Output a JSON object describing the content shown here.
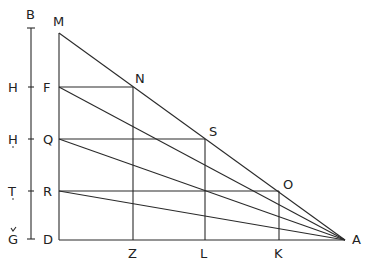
{
  "diagram": {
    "type": "geometric-figure",
    "scale_bar": {
      "top_label": "B",
      "tick_labels": [
        "H",
        "H",
        "T",
        "G"
      ],
      "x": 31,
      "y_top": 28,
      "y_bottom": 239,
      "ticks_y": [
        87,
        139,
        191
      ]
    },
    "points": {
      "M": {
        "label": "M",
        "x": 59,
        "y": 33
      },
      "F": {
        "label": "F",
        "x": 59,
        "y": 87
      },
      "Q": {
        "label": "Q",
        "x": 59,
        "y": 139
      },
      "R": {
        "label": "R",
        "x": 59,
        "y": 191
      },
      "D": {
        "label": "D",
        "x": 59,
        "y": 240
      },
      "N": {
        "label": "N",
        "x": 133,
        "y": 87
      },
      "S": {
        "label": "S",
        "x": 205,
        "y": 140
      },
      "O": {
        "label": "O",
        "x": 279,
        "y": 193
      },
      "Z": {
        "label": "Z",
        "x": 133,
        "y": 240
      },
      "L": {
        "label": "L",
        "x": 205,
        "y": 240
      },
      "K": {
        "label": "K",
        "x": 279,
        "y": 240
      },
      "A": {
        "label": "A",
        "x": 345,
        "y": 240
      }
    },
    "segments": [
      [
        "M",
        "D"
      ],
      [
        "D",
        "A"
      ],
      [
        "M",
        "A"
      ],
      [
        "F",
        "A"
      ],
      [
        "Q",
        "A"
      ],
      [
        "R",
        "A"
      ],
      [
        "F",
        "N"
      ],
      [
        "Q",
        "S"
      ],
      [
        "R",
        "O"
      ],
      [
        "N",
        "Z"
      ],
      [
        "S",
        "L"
      ],
      [
        "O",
        "K"
      ]
    ]
  }
}
